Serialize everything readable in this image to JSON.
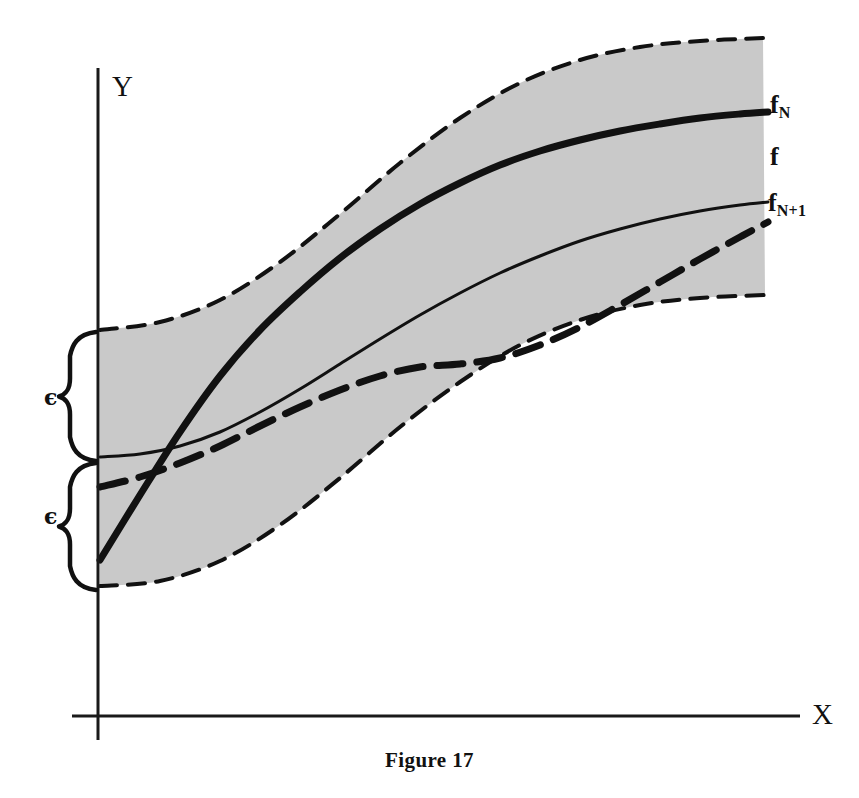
{
  "figure": {
    "caption": "Figure 17",
    "caption_y": 748
  },
  "axes": {
    "y_label": "Y",
    "x_label": "X",
    "origin": {
      "x": 98,
      "y": 716
    },
    "y_top": 68,
    "y_bottom": 740,
    "x_right": 800,
    "color": "#1a1a1a",
    "width": 3
  },
  "band": {
    "fill_color": "#c9c9c9",
    "border_color": "#111111",
    "border_width": 4,
    "dash": "17,11",
    "label": "epsilon-band"
  },
  "curves": {
    "f_N": {
      "label": "f",
      "subscript": "N",
      "style": "solid-bold",
      "width": 7,
      "color": "#111111",
      "label_x": 770,
      "label_y": 92
    },
    "f": {
      "label": "f",
      "subscript": "",
      "style": "solid-thin",
      "width": 3,
      "color": "#111111",
      "label_x": 770,
      "label_y": 144
    },
    "f_N_plus_1": {
      "label": "f",
      "subscript": "N+1",
      "style": "dashed-bold",
      "width": 7,
      "color": "#111111",
      "dash": "26,14",
      "label_x": 768,
      "label_y": 190
    }
  },
  "braces": [
    {
      "name": "upper",
      "symbol": "ϵ",
      "label_x": 44,
      "label_y": 386,
      "top": 332,
      "bottom": 461
    },
    {
      "name": "lower",
      "symbol": "ϵ",
      "label_x": 44,
      "label_y": 505,
      "top": 463,
      "bottom": 590
    }
  ],
  "chart_data": {
    "type": "line",
    "title": "Figure 17",
    "xlabel": "X",
    "ylabel": "Y",
    "grid": false,
    "legend": "inline-right",
    "annotations": [
      "ϵ",
      "ϵ"
    ],
    "series": [
      {
        "name": "band_upper_boundary",
        "style": "dashed",
        "points": [
          [
            100,
            330
          ],
          [
            160,
            322
          ],
          [
            220,
            300
          ],
          [
            280,
            262
          ],
          [
            340,
            214
          ],
          [
            400,
            163
          ],
          [
            460,
            118
          ],
          [
            520,
            83
          ],
          [
            580,
            60
          ],
          [
            640,
            47
          ],
          [
            700,
            41
          ],
          [
            763,
            38
          ]
        ]
      },
      {
        "name": "band_lower_boundary",
        "style": "dashed",
        "points": [
          [
            100,
            586
          ],
          [
            160,
            581
          ],
          [
            220,
            561
          ],
          [
            280,
            525
          ],
          [
            340,
            478
          ],
          [
            400,
            427
          ],
          [
            460,
            382
          ],
          [
            520,
            345
          ],
          [
            580,
            320
          ],
          [
            640,
            305
          ],
          [
            700,
            298
          ],
          [
            765,
            295
          ]
        ]
      },
      {
        "name": "f_N",
        "style": "solid-bold",
        "points": [
          [
            100,
            560
          ],
          [
            140,
            495
          ],
          [
            180,
            432
          ],
          [
            220,
            376
          ],
          [
            260,
            330
          ],
          [
            300,
            292
          ],
          [
            340,
            258
          ],
          [
            380,
            229
          ],
          [
            420,
            204
          ],
          [
            460,
            183
          ],
          [
            500,
            165
          ],
          [
            540,
            151
          ],
          [
            580,
            140
          ],
          [
            620,
            131
          ],
          [
            660,
            124
          ],
          [
            700,
            118
          ],
          [
            740,
            114
          ],
          [
            768,
            112
          ]
        ]
      },
      {
        "name": "f",
        "style": "solid-thin",
        "points": [
          [
            100,
            457
          ],
          [
            140,
            454
          ],
          [
            180,
            446
          ],
          [
            220,
            432
          ],
          [
            260,
            412
          ],
          [
            300,
            389
          ],
          [
            340,
            364
          ],
          [
            380,
            339
          ],
          [
            420,
            315
          ],
          [
            460,
            293
          ],
          [
            500,
            273
          ],
          [
            540,
            256
          ],
          [
            580,
            241
          ],
          [
            620,
            229
          ],
          [
            660,
            219
          ],
          [
            700,
            211
          ],
          [
            740,
            205
          ],
          [
            768,
            202
          ]
        ]
      },
      {
        "name": "f_N_plus_1",
        "style": "dashed-bold",
        "points": [
          [
            100,
            487
          ],
          [
            140,
            477
          ],
          [
            180,
            463
          ],
          [
            220,
            446
          ],
          [
            260,
            426
          ],
          [
            300,
            407
          ],
          [
            340,
            390
          ],
          [
            380,
            376
          ],
          [
            420,
            367
          ],
          [
            460,
            364
          ],
          [
            500,
            358
          ],
          [
            540,
            345
          ],
          [
            580,
            327
          ],
          [
            620,
            305
          ],
          [
            660,
            282
          ],
          [
            700,
            259
          ],
          [
            740,
            237
          ],
          [
            768,
            222
          ]
        ]
      }
    ]
  }
}
